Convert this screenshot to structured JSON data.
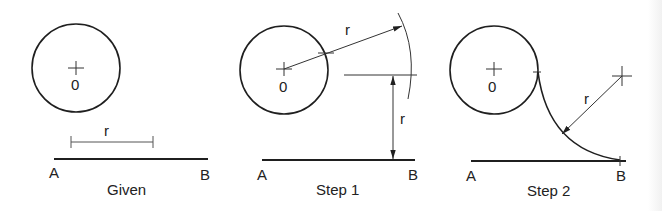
{
  "colors": {
    "stroke": "#1f1f1f",
    "thin": "#555555",
    "background": "#ffffff"
  },
  "panels": [
    {
      "id": "given",
      "caption": "Given",
      "center_label": "0",
      "radius_label": "r",
      "line_start_label": "A",
      "line_end_label": "B"
    },
    {
      "id": "step1",
      "caption": "Step 1",
      "center_label": "0",
      "radius_label_arc": "r",
      "radius_label_offset": "r",
      "line_start_label": "A",
      "line_end_label": "B"
    },
    {
      "id": "step2",
      "caption": "Step 2",
      "center_label": "0",
      "radius_label": "r",
      "line_start_label": "A",
      "line_end_label": "B"
    }
  ]
}
